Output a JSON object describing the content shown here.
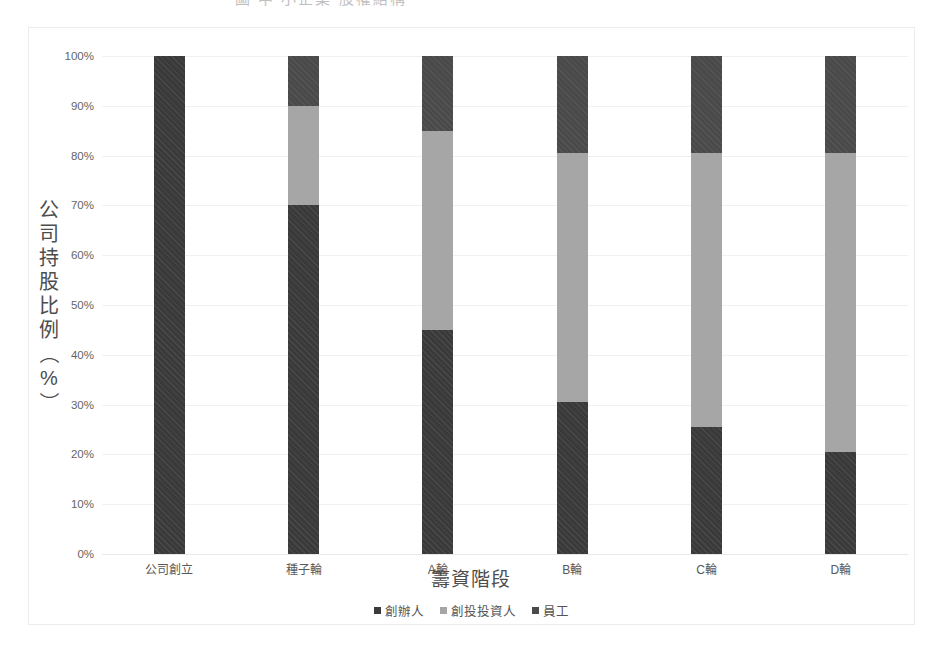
{
  "title": {
    "cutoff_text": "圖 中 小企業 股權結構"
  },
  "axes": {
    "y_title_chars": [
      "公",
      "司",
      "持",
      "股",
      "比",
      "例",
      "（",
      "%",
      "）"
    ],
    "y_title_full": "公司持股比例（%）",
    "x_title": "籌資階段",
    "y_ticks": [
      "100%",
      "90%",
      "80%",
      "70%",
      "60%",
      "50%",
      "40%",
      "30%",
      "20%",
      "10%",
      "0%"
    ]
  },
  "legend": {
    "items": [
      {
        "label": "創辦人",
        "color": "#3a3a3a"
      },
      {
        "label": "創投投資人",
        "color": "#a6a6a6"
      },
      {
        "label": "員工",
        "color": "#4a4a4a"
      }
    ]
  },
  "chart_data": {
    "type": "bar",
    "stacked": true,
    "stack_mode": "percent",
    "title": "圖 中 小企業 股權結構",
    "xlabel": "籌資階段",
    "ylabel": "公司持股比例（%）",
    "ylim": [
      0,
      100
    ],
    "ytick_values": [
      0,
      10,
      20,
      30,
      40,
      50,
      60,
      70,
      80,
      90,
      100
    ],
    "grid": true,
    "legend_position": "bottom",
    "categories": [
      "公司創立",
      "種子輪",
      "A輪",
      "B輪",
      "C輪",
      "D輪"
    ],
    "series": [
      {
        "name": "創辦人",
        "color": "#3a3a3a",
        "values": [
          100,
          70,
          45,
          30.5,
          25.5,
          20.5
        ]
      },
      {
        "name": "創投投資人",
        "color": "#a6a6a6",
        "values": [
          0,
          20,
          40,
          50,
          55,
          60
        ]
      },
      {
        "name": "員工",
        "color": "#4a4a4a",
        "values": [
          0,
          10,
          15,
          19.5,
          19.5,
          19.5
        ]
      }
    ]
  }
}
